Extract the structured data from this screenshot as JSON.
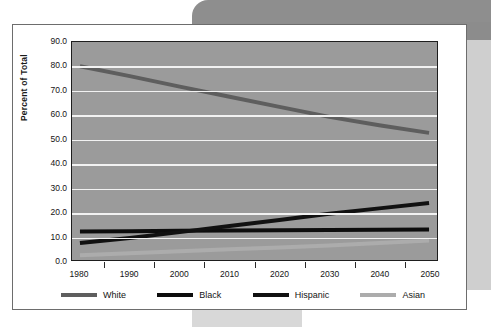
{
  "chart_data": {
    "type": "line",
    "title": "",
    "xlabel": "",
    "ylabel": "Percent of Total",
    "x": [
      1980,
      1990,
      2000,
      2010,
      2020,
      2030,
      2040,
      2050
    ],
    "xticklabels": [
      "1980",
      "1990",
      "2000",
      "2010",
      "2020",
      "2030",
      "2040",
      "2050"
    ],
    "yticklabels": [
      "90.0",
      "80.0",
      "70.0",
      "60.0",
      "50.0",
      "40.0",
      "30.0",
      "20.0",
      "10.0",
      "0.0"
    ],
    "yticks": [
      90.0,
      80.0,
      70.0,
      60.0,
      50.0,
      40.0,
      30.0,
      20.0,
      10.0,
      0.0
    ],
    "ylim": [
      0.0,
      90.0
    ],
    "xlim": [
      1980,
      2050
    ],
    "grid": "horizontal",
    "legend_position": "bottom",
    "plot_background": "#9b9b9b",
    "gridline_color": "#f2f2f2",
    "series": [
      {
        "name": "White",
        "color": "#5e5e5e",
        "values": [
          80.0,
          75.9,
          71.6,
          67.4,
          63.2,
          59.1,
          55.6,
          52.5
        ]
      },
      {
        "name": "Black",
        "color": "#0d0d0d",
        "values": [
          11.8,
          11.9,
          12.1,
          12.2,
          12.3,
          12.4,
          12.5,
          12.6
        ]
      },
      {
        "name": "Hispanic",
        "color": "#111111",
        "values": [
          7.0,
          9.1,
          11.5,
          14.0,
          16.5,
          19.1,
          21.3,
          23.5
        ]
      },
      {
        "name": "Asian",
        "color": "#acacac",
        "values": [
          2.0,
          2.8,
          3.6,
          4.4,
          5.2,
          6.0,
          7.0,
          8.0
        ]
      }
    ]
  },
  "legend": {
    "items": [
      {
        "label": "White",
        "color": "#5e5e5e"
      },
      {
        "label": "Black",
        "color": "#0d0d0d"
      },
      {
        "label": "Hispanic",
        "color": "#111111"
      },
      {
        "label": "Asian",
        "color": "#acacac"
      }
    ]
  }
}
